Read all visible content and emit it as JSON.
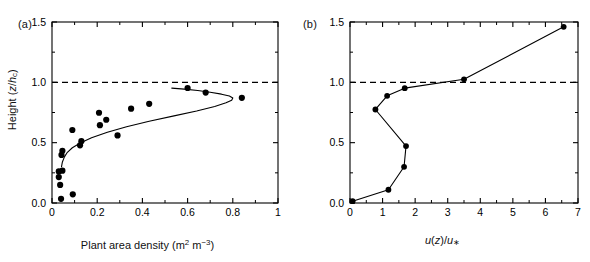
{
  "figure": {
    "width": 590,
    "height": 262,
    "background": "#ffffff",
    "ink": "#000000"
  },
  "panels": [
    {
      "tag": "(a)",
      "xlabel_plain": "Plant area density (m2 m-3)",
      "ylabel_plain": "Height (z/hc)",
      "xticks": [
        "0.0",
        "0.2",
        "0.4",
        "0.6",
        "0.8",
        "1.0"
      ],
      "yticks": [
        "0.0",
        "0.5",
        "1.0",
        "1.5"
      ]
    },
    {
      "tag": "(b)",
      "xlabel_plain": "u(z)/u*",
      "ylabel_plain": "",
      "xticks": [
        "0",
        "1",
        "2",
        "3",
        "4",
        "5",
        "6",
        "7"
      ],
      "yticks": [
        "0.0",
        "0.5",
        "1.0",
        "1.5"
      ]
    }
  ],
  "chart_data": [
    {
      "type": "scatter",
      "panel": "(a)",
      "title": "",
      "xlabel": "Plant area density (m² m⁻³)",
      "ylabel": "Height (z/h_c)",
      "xlim": [
        0.0,
        1.0
      ],
      "ylim": [
        0.0,
        1.5
      ],
      "xticks": [
        0.0,
        0.2,
        0.4,
        0.6,
        0.8,
        1.0
      ],
      "yticks": [
        0.0,
        0.5,
        1.0,
        1.5
      ],
      "grid": false,
      "legend": "none",
      "annotations": [
        {
          "kind": "dashed-horizontal-line",
          "y": 1.0,
          "label": "canopy height z/h_c = 1"
        }
      ],
      "series": [
        {
          "name": "Measured plant area density",
          "marker": "filled-circle",
          "color": "#000000",
          "points": [
            {
              "x": 0.04,
              "y": 0.035
            },
            {
              "x": 0.092,
              "y": 0.072
            },
            {
              "x": 0.036,
              "y": 0.15
            },
            {
              "x": 0.03,
              "y": 0.215
            },
            {
              "x": 0.03,
              "y": 0.262
            },
            {
              "x": 0.046,
              "y": 0.268
            },
            {
              "x": 0.042,
              "y": 0.398
            },
            {
              "x": 0.046,
              "y": 0.432
            },
            {
              "x": 0.124,
              "y": 0.478
            },
            {
              "x": 0.13,
              "y": 0.512
            },
            {
              "x": 0.29,
              "y": 0.56
            },
            {
              "x": 0.09,
              "y": 0.605
            },
            {
              "x": 0.212,
              "y": 0.645
            },
            {
              "x": 0.24,
              "y": 0.69
            },
            {
              "x": 0.208,
              "y": 0.748
            },
            {
              "x": 0.35,
              "y": 0.782
            },
            {
              "x": 0.43,
              "y": 0.822
            },
            {
              "x": 0.84,
              "y": 0.872
            },
            {
              "x": 0.68,
              "y": 0.915
            },
            {
              "x": 0.6,
              "y": 0.953
            }
          ]
        },
        {
          "name": "Fitted plant area density profile",
          "marker": "none",
          "line": "solid",
          "color": "#000000",
          "points": [
            {
              "x": 0.53,
              "y": 0.952
            },
            {
              "x": 0.585,
              "y": 0.944
            },
            {
              "x": 0.645,
              "y": 0.932
            },
            {
              "x": 0.7,
              "y": 0.918
            },
            {
              "x": 0.75,
              "y": 0.902
            },
            {
              "x": 0.785,
              "y": 0.886
            },
            {
              "x": 0.8,
              "y": 0.87
            },
            {
              "x": 0.795,
              "y": 0.852
            },
            {
              "x": 0.77,
              "y": 0.83
            },
            {
              "x": 0.72,
              "y": 0.8
            },
            {
              "x": 0.64,
              "y": 0.762
            },
            {
              "x": 0.54,
              "y": 0.722
            },
            {
              "x": 0.43,
              "y": 0.678
            },
            {
              "x": 0.33,
              "y": 0.632
            },
            {
              "x": 0.245,
              "y": 0.586
            },
            {
              "x": 0.175,
              "y": 0.54
            },
            {
              "x": 0.125,
              "y": 0.498
            },
            {
              "x": 0.09,
              "y": 0.458
            },
            {
              "x": 0.068,
              "y": 0.42
            },
            {
              "x": 0.055,
              "y": 0.382
            },
            {
              "x": 0.046,
              "y": 0.34
            },
            {
              "x": 0.042,
              "y": 0.3
            }
          ]
        }
      ]
    },
    {
      "type": "line",
      "panel": "(b)",
      "title": "",
      "xlabel": "u(z)/u∗",
      "ylabel": "Height (z/h_c)",
      "xlim": [
        0,
        7
      ],
      "ylim": [
        0.0,
        1.5
      ],
      "xticks": [
        0,
        1,
        2,
        3,
        4,
        5,
        6,
        7
      ],
      "yticks": [
        0.0,
        0.5,
        1.0,
        1.5
      ],
      "grid": false,
      "legend": "none",
      "annotations": [
        {
          "kind": "dashed-horizontal-line",
          "y": 1.0,
          "label": "canopy height z/h_c = 1"
        }
      ],
      "series": [
        {
          "name": "Normalised wind speed profile",
          "marker": "filled-circle",
          "line": "solid",
          "color": "#000000",
          "points": [
            {
              "x": 0.08,
              "y": 0.015
            },
            {
              "x": 1.18,
              "y": 0.11
            },
            {
              "x": 1.66,
              "y": 0.3
            },
            {
              "x": 1.72,
              "y": 0.472
            },
            {
              "x": 0.78,
              "y": 0.775
            },
            {
              "x": 1.14,
              "y": 0.888
            },
            {
              "x": 1.68,
              "y": 0.952
            },
            {
              "x": 3.5,
              "y": 1.025
            },
            {
              "x": 6.56,
              "y": 1.46
            }
          ]
        }
      ]
    }
  ]
}
